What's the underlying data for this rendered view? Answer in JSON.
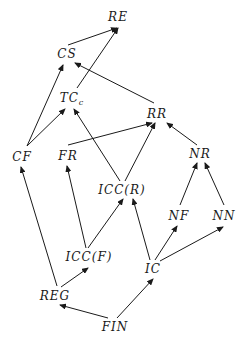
{
  "diagram": {
    "type": "directed-hasse-diagram",
    "nodes": [
      {
        "id": "RE",
        "label": "RE",
        "sub": "",
        "x": 118,
        "y": 17
      },
      {
        "id": "CS",
        "label": "CS",
        "sub": "",
        "x": 67,
        "y": 54
      },
      {
        "id": "TCc",
        "label": "TC",
        "sub": "c",
        "x": 72,
        "y": 98
      },
      {
        "id": "RR",
        "label": "RR",
        "sub": "",
        "x": 157,
        "y": 114
      },
      {
        "id": "CF",
        "label": "CF",
        "sub": "",
        "x": 22,
        "y": 157
      },
      {
        "id": "FR",
        "label": "FR",
        "sub": "",
        "x": 68,
        "y": 156
      },
      {
        "id": "NR",
        "label": "NR",
        "sub": "",
        "x": 200,
        "y": 154
      },
      {
        "id": "ICCR",
        "label": "ICC(R)",
        "sub": "",
        "x": 122,
        "y": 190
      },
      {
        "id": "NF",
        "label": "NF",
        "sub": "",
        "x": 179,
        "y": 216
      },
      {
        "id": "NN",
        "label": "NN",
        "sub": "",
        "x": 224,
        "y": 216
      },
      {
        "id": "ICCF",
        "label": "ICC(F)",
        "sub": "",
        "x": 89,
        "y": 257
      },
      {
        "id": "IC",
        "label": "IC",
        "sub": "",
        "x": 153,
        "y": 269
      },
      {
        "id": "REG",
        "label": "REG",
        "sub": "",
        "x": 55,
        "y": 296
      },
      {
        "id": "FIN",
        "label": "FIN",
        "sub": "",
        "x": 115,
        "y": 327
      }
    ],
    "edges": [
      {
        "from": "CS",
        "to": "RE",
        "x1": 68,
        "y1": 45,
        "x2": 117,
        "y2": 28
      },
      {
        "from": "TCc",
        "to": "RE",
        "x1": 77,
        "y1": 88,
        "x2": 118,
        "y2": 28
      },
      {
        "from": "RR",
        "to": "CS",
        "x1": 154,
        "y1": 103,
        "x2": 75,
        "y2": 63
      },
      {
        "from": "CF",
        "to": "CS",
        "x1": 27,
        "y1": 146,
        "x2": 63,
        "y2": 65
      },
      {
        "from": "CF",
        "to": "TCc",
        "x1": 27,
        "y1": 146,
        "x2": 65,
        "y2": 109
      },
      {
        "from": "ICCR",
        "to": "TCc",
        "x1": 120,
        "y1": 181,
        "x2": 74,
        "y2": 109
      },
      {
        "from": "FR",
        "to": "RR",
        "x1": 68,
        "y1": 145,
        "x2": 152,
        "y2": 123
      },
      {
        "from": "ICCR",
        "to": "RR",
        "x1": 125,
        "y1": 181,
        "x2": 155,
        "y2": 123
      },
      {
        "from": "NR",
        "to": "RR",
        "x1": 197,
        "y1": 145,
        "x2": 167,
        "y2": 123
      },
      {
        "from": "NF",
        "to": "NR",
        "x1": 180,
        "y1": 205,
        "x2": 197,
        "y2": 163
      },
      {
        "from": "NN",
        "to": "NR",
        "x1": 224,
        "y1": 205,
        "x2": 205,
        "y2": 163
      },
      {
        "from": "ICCF",
        "to": "FR",
        "x1": 86,
        "y1": 248,
        "x2": 67,
        "y2": 166
      },
      {
        "from": "ICCF",
        "to": "ICCR",
        "x1": 88,
        "y1": 248,
        "x2": 123,
        "y2": 199
      },
      {
        "from": "IC",
        "to": "ICCR",
        "x1": 150,
        "y1": 260,
        "x2": 133,
        "y2": 199
      },
      {
        "from": "IC",
        "to": "NF",
        "x1": 155,
        "y1": 260,
        "x2": 177,
        "y2": 226
      },
      {
        "from": "IC",
        "to": "NN",
        "x1": 160,
        "y1": 261,
        "x2": 223,
        "y2": 227
      },
      {
        "from": "REG",
        "to": "CF",
        "x1": 57,
        "y1": 286,
        "x2": 21,
        "y2": 167
      },
      {
        "from": "REG",
        "to": "ICCF",
        "x1": 61,
        "y1": 287,
        "x2": 88,
        "y2": 268
      },
      {
        "from": "FIN",
        "to": "REG",
        "x1": 108,
        "y1": 318,
        "x2": 60,
        "y2": 305
      },
      {
        "from": "FIN",
        "to": "IC",
        "x1": 117,
        "y1": 318,
        "x2": 153,
        "y2": 279
      }
    ]
  }
}
